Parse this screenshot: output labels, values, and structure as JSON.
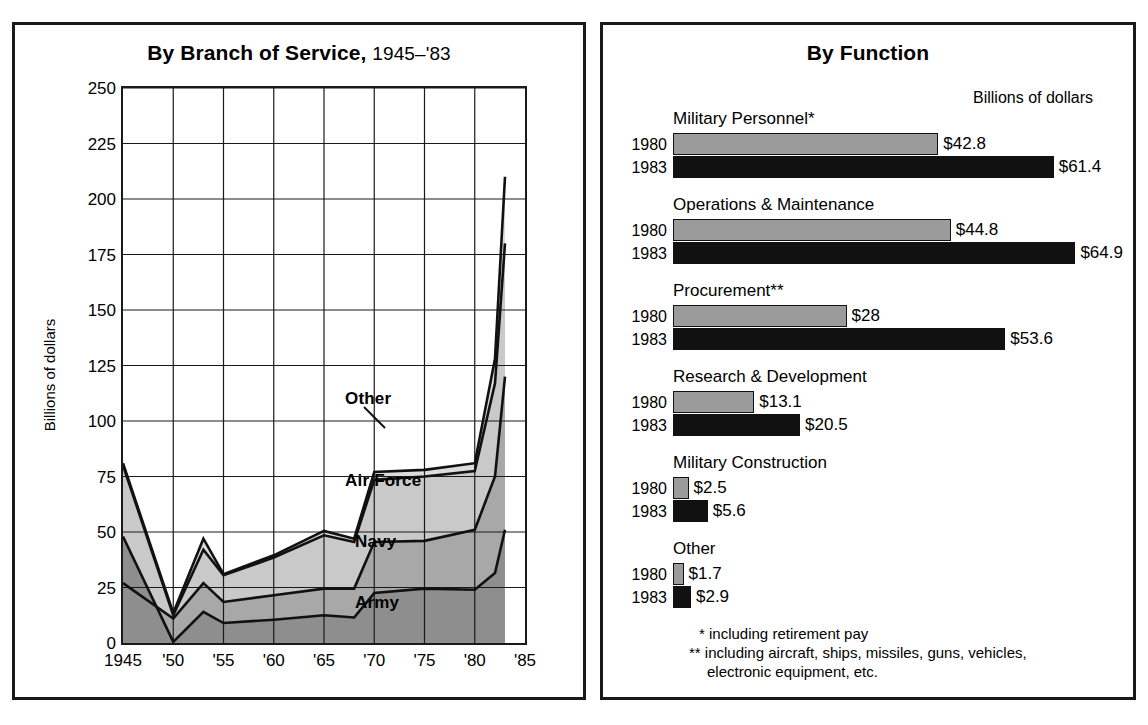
{
  "left_panel": {
    "title_bold": "By Branch of Service,",
    "title_light": "1945–'83",
    "ylabel": "Billions of dollars",
    "yticks": [
      "0",
      "25",
      "50",
      "75",
      "100",
      "125",
      "150",
      "175",
      "200",
      "225",
      "250"
    ],
    "xticks": [
      "1945",
      "'50",
      "'55",
      "'60",
      "'65",
      "'70",
      "'75",
      "'80",
      "'85"
    ],
    "series_labels": {
      "other": "Other",
      "air_force": "Air Force",
      "navy": "Navy",
      "army": "Army"
    }
  },
  "right_panel": {
    "title": "By Function",
    "units": "Billions of dollars",
    "year_1980": "1980",
    "year_1983": "1983",
    "groups": [
      {
        "name": "Military Personnel*",
        "v1980": 42.8,
        "v1983": 61.4,
        "l1980": "$42.8",
        "l1983": "$61.4"
      },
      {
        "name": "Operations & Maintenance",
        "v1980": 44.8,
        "v1983": 64.9,
        "l1980": "$44.8",
        "l1983": "$64.9"
      },
      {
        "name": "Procurement**",
        "v1980": 28.0,
        "v1983": 53.6,
        "l1980": "$28",
        "l1983": "$53.6"
      },
      {
        "name": "Research & Development",
        "v1980": 13.1,
        "v1983": 20.5,
        "l1980": "$13.1",
        "l1983": "$20.5"
      },
      {
        "name": "Military Construction",
        "v1980": 2.5,
        "v1983": 5.6,
        "l1980": "$2.5",
        "l1983": "$5.6"
      },
      {
        "name": "Other",
        "v1980": 1.7,
        "v1983": 2.9,
        "l1980": "$1.7",
        "l1983": "$2.9"
      }
    ],
    "footnotes": [
      "* including retirement pay",
      "** including aircraft, ships, missiles, guns, vehicles,",
      "electronic equipment, etc."
    ]
  },
  "colors": {
    "ink": "#1a1a1a",
    "gray_light": "#d3d3d3",
    "gray_mid": "#9b9b9b",
    "gray_dark": "#7d7d7d",
    "bar_1980": "#9b9b9b",
    "bar_1983": "#111111"
  },
  "chart_data": [
    {
      "type": "area",
      "title": "By Branch of Service, 1945-'83",
      "xlabel": "",
      "ylabel": "Billions of dollars",
      "ylim": [
        0,
        250
      ],
      "grid": true,
      "stacked": true,
      "legend": "inline-labels",
      "x": [
        1945,
        1950,
        1953,
        1955,
        1960,
        1965,
        1968,
        1970,
        1975,
        1980,
        1983
      ],
      "tick_labels": [
        "1945",
        "'50",
        "'55",
        "'60",
        "'65",
        "'70",
        "'75",
        "'80",
        "'85"
      ],
      "series": [
        {
          "name": "Army",
          "values": [
            48,
            0.5,
            14,
            9,
            10.5,
            12.5,
            11.5,
            22.5,
            24.5,
            24,
            31.5,
            51
          ]
        },
        {
          "name": "Navy",
          "values": [
            27,
            11,
            27,
            18.5,
            21.5,
            24.5,
            24.5,
            45.5,
            46,
            51,
            75,
            120
          ]
        },
        {
          "name": "Air Force",
          "values": [
            80,
            12.5,
            42,
            30.5,
            38.5,
            48.5,
            45.5,
            73.5,
            75,
            77.5,
            117,
            180
          ]
        },
        {
          "name": "Other",
          "values": [
            81,
            13.5,
            47,
            31,
            39.5,
            50.5,
            47,
            77,
            78,
            81,
            128,
            210
          ]
        }
      ],
      "series_note": "values are cumulative upper boundaries of each stacked band"
    },
    {
      "type": "bar",
      "orientation": "horizontal",
      "title": "By Function",
      "xlabel": "Billions of dollars",
      "categories": [
        "Military Personnel*",
        "Operations & Maintenance",
        "Procurement**",
        "Research & Development",
        "Military Construction",
        "Other"
      ],
      "series": [
        {
          "name": "1980",
          "values": [
            42.8,
            44.8,
            28,
            13.1,
            2.5,
            1.7
          ]
        },
        {
          "name": "1983",
          "values": [
            61.4,
            64.9,
            53.6,
            20.5,
            5.6,
            2.9
          ]
        }
      ]
    }
  ]
}
